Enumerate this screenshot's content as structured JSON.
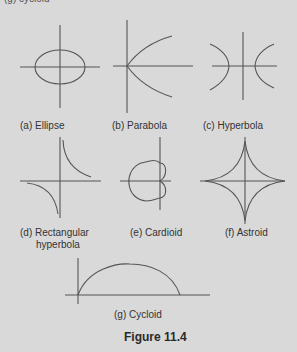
{
  "top_fragment": "(g) cycloid",
  "panels": [
    {
      "id": "a",
      "label": "(a) Ellipse",
      "shape": "ellipse"
    },
    {
      "id": "b",
      "label": "(b) Parabola",
      "shape": "parabola"
    },
    {
      "id": "c",
      "label": "(c) Hyperbola",
      "shape": "hyperbola"
    },
    {
      "id": "d",
      "label_line1": "(d) Rectangular",
      "label_line2": "hyperbola",
      "shape": "rectangular-hyperbola"
    },
    {
      "id": "e",
      "label": "(e) Cardioid",
      "shape": "cardioid"
    },
    {
      "id": "f",
      "label": "(f) Astroid",
      "shape": "astroid"
    },
    {
      "id": "g",
      "label": "(g) Cycloid",
      "shape": "cycloid"
    }
  ],
  "caption": "Figure 11.4",
  "colors": {
    "background": "#d9d9d9",
    "stroke": "#555555",
    "text": "#333333"
  }
}
